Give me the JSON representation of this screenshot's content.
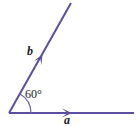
{
  "figure": {
    "type": "geometry-diagram",
    "background_color": "#ffffff",
    "stroke_color": "#5a4fa0",
    "text_color": "#1a1a1a",
    "width": 139,
    "height": 126
  },
  "labels": {
    "vector_b": "b",
    "vector_a": "a",
    "angle": "60°"
  },
  "geometry": {
    "vertex": {
      "x": 9,
      "y": 113
    },
    "ray_a": {
      "name": "a",
      "from": {
        "x": 9,
        "y": 113
      },
      "to": {
        "x": 133,
        "y": 113
      },
      "arrow_at": {
        "x": 70,
        "y": 113
      },
      "direction_deg": 0
    },
    "ray_b": {
      "name": "b",
      "from": {
        "x": 9,
        "y": 113
      },
      "to": {
        "x": 71,
        "y": 3
      },
      "arrow_at": {
        "x": 41,
        "y": 58
      },
      "direction_deg": 60
    },
    "arc": {
      "center": {
        "x": 9,
        "y": 113
      },
      "radius": 22,
      "start_deg": 0,
      "end_deg": 60
    }
  }
}
